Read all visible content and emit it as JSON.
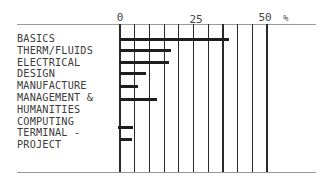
{
  "chart_data": {
    "type": "bar",
    "orientation": "horizontal",
    "title": "",
    "xlabel": "%",
    "ylabel": "",
    "xlim": [
      0,
      50
    ],
    "x_ticks": [
      "0",
      "25",
      "50"
    ],
    "x_unit": "%",
    "grid": true,
    "grid_step": 5,
    "legend": null,
    "categories": [
      "BASICS",
      "THERM/FLUIDS",
      "ELECTRICAL",
      "DESIGN",
      "MANUFACTURE",
      "MANAGEMENT & HUMANITIES",
      "COMPUTING",
      "TERMINAL - PROJECT"
    ],
    "values": [
      37,
      17.5,
      16.5,
      9,
      6,
      12.5,
      4.5,
      4
    ]
  },
  "labels": {
    "tick_0": "0",
    "tick_25": "25",
    "tick_50": "50",
    "unit": "%",
    "rows": [
      "BASICS",
      "THERM/FLUIDS",
      "ELECTRICAL",
      "DESIGN",
      "MANUFACTURE",
      "MANAGEMENT &",
      "HUMANITIES",
      "COMPUTING",
      "TERMINAL -",
      "PROJECT"
    ]
  }
}
